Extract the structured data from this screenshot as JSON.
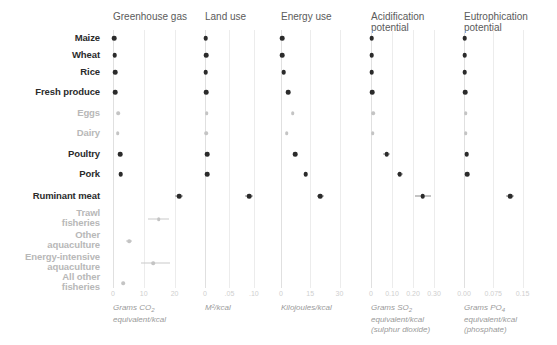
{
  "chart_data": {
    "type": "scatter",
    "title": "",
    "layout": "small-multiples, 5 panels sharing shared categorical y-axis",
    "grid": true,
    "legend": null,
    "categories": [
      "Maize",
      "Wheat",
      "Rice",
      "Fresh produce",
      "Eggs",
      "Dairy",
      "Poultry",
      "Pork",
      "Ruminant meat",
      "Trawl fisheries",
      "Other aquaculture",
      "Energy-intensive aquaculture",
      "All other fisheries"
    ],
    "category_emphasis": [
      "dark",
      "dark",
      "dark",
      "dark",
      "light",
      "light",
      "dark",
      "dark",
      "dark",
      "light",
      "light",
      "light",
      "light"
    ],
    "panels": [
      {
        "title": "Greenhouse gas",
        "xlabel": "Grams CO2 equivalent/kcal",
        "xlabel_lines": [
          "Grams CO",
          "equivalent/kcal"
        ],
        "xlabel_sub": "2",
        "xlim": [
          0,
          26
        ],
        "ticks": [
          0,
          10,
          20
        ],
        "tick_labels": [
          "0",
          "10",
          "20"
        ],
        "values": [
          0.4,
          0.5,
          0.7,
          0.8,
          1.6,
          1.5,
          2.4,
          2.5,
          21.5,
          14.8,
          5.2,
          13.0,
          3.4
        ],
        "low": [
          0.4,
          0.5,
          0.7,
          0.8,
          1.6,
          1.5,
          2.4,
          2.5,
          20.3,
          11.3,
          4.1,
          9.1,
          3.4
        ],
        "high": [
          0.4,
          0.5,
          0.7,
          0.8,
          1.6,
          1.5,
          2.4,
          2.5,
          22.7,
          18.1,
          6.2,
          18.4,
          3.4
        ]
      },
      {
        "title": "Land use",
        "xlabel": "M2/kcal",
        "xlabel_lines": [
          "M²/kcal"
        ],
        "xlim": [
          0,
          0.135
        ],
        "ticks": [
          0,
          0.05,
          0.1
        ],
        "tick_labels": [
          "0",
          ".05",
          ".10"
        ],
        "values": [
          0.0018,
          0.0022,
          0.0016,
          0.0021,
          0.0035,
          0.003,
          0.004,
          0.0048,
          0.0905,
          null,
          null,
          null,
          null
        ],
        "low": [
          0.0018,
          0.0022,
          0.0016,
          0.0021,
          0.0035,
          0.003,
          0.004,
          0.0048,
          0.0815,
          null,
          null,
          null,
          null
        ],
        "high": [
          0.0018,
          0.0022,
          0.0016,
          0.0021,
          0.0035,
          0.003,
          0.004,
          0.0048,
          0.099,
          null,
          null,
          null,
          null
        ]
      },
      {
        "title": "Energy use",
        "xlabel": "Kilojoules/kcal",
        "xlabel_lines": [
          "Kilojoules/kcal"
        ],
        "xlim": [
          0,
          40
        ],
        "ticks": [
          0,
          15,
          30
        ],
        "tick_labels": [
          "0",
          "15",
          "30"
        ],
        "values": [
          0.6,
          0.7,
          1.4,
          3.6,
          5.9,
          3.0,
          7.4,
          12.6,
          20.0,
          null,
          null,
          null,
          null
        ],
        "low": [
          0.6,
          0.7,
          1.4,
          3.6,
          5.9,
          3.0,
          7.4,
          12.6,
          18.3,
          null,
          null,
          null,
          null
        ],
        "high": [
          0.6,
          0.7,
          1.4,
          3.6,
          5.9,
          3.0,
          7.4,
          12.6,
          22.2,
          null,
          null,
          null,
          null
        ]
      },
      {
        "title": "Acidification potential",
        "xlabel": "Grams SO2 equivalent/kcal (sulphur dioxide)",
        "xlabel_lines": [
          "Grams SO",
          "equivalent/kcal",
          "(sulphur dioxide)"
        ],
        "xlabel_sub": "2",
        "xlim": [
          0,
          0.4
        ],
        "ticks": [
          0,
          0.1,
          0.2,
          0.3
        ],
        "tick_labels": [
          "0",
          "0.10",
          "0.20",
          "0.30"
        ],
        "values": [
          0.004,
          0.004,
          0.004,
          0.005,
          0.011,
          0.009,
          0.075,
          0.137,
          0.247,
          null,
          null,
          null,
          null
        ],
        "low": [
          0.004,
          0.004,
          0.004,
          0.005,
          0.011,
          0.009,
          0.058,
          0.125,
          0.209,
          null,
          null,
          null,
          null
        ],
        "high": [
          0.004,
          0.004,
          0.004,
          0.005,
          0.011,
          0.009,
          0.09,
          0.15,
          0.287,
          null,
          null,
          null,
          null
        ]
      },
      {
        "title": "Eutrophication potential",
        "xlabel": "Grams PO4 equivalent/kcal (phosphate)",
        "xlabel_lines": [
          "Grams PO",
          "equivalent/kcal",
          "(phosphate)"
        ],
        "xlabel_sub": "4",
        "xlim": [
          0,
          0.2
        ],
        "ticks": [
          0.0,
          0.075,
          0.15
        ],
        "tick_labels": [
          "0.00",
          "0.075",
          "0.15"
        ],
        "values": [
          0.0016,
          0.0018,
          0.002,
          0.003,
          0.0048,
          0.0042,
          0.0065,
          0.0078,
          0.118,
          null,
          null,
          null,
          null
        ],
        "low": [
          0.0016,
          0.0018,
          0.002,
          0.003,
          0.0048,
          0.0042,
          0.0065,
          0.0078,
          0.1075,
          null,
          null,
          null,
          null
        ],
        "high": [
          0.0016,
          0.0018,
          0.002,
          0.003,
          0.0048,
          0.0042,
          0.0065,
          0.0078,
          0.129,
          null,
          null,
          null,
          null
        ]
      }
    ],
    "colors": {
      "dark_mark": "#2b2b2b",
      "light_mark": "#c4c4c4",
      "gridline": "#ececec",
      "tick_text": "#cfcfcf",
      "caption_text": "#9a9a9a",
      "title_text": "#5b5b5b"
    }
  }
}
